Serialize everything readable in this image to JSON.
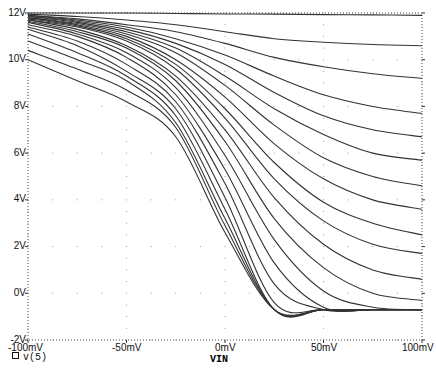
{
  "chart_data": {
    "type": "line",
    "title": "",
    "xlabel": "VIN",
    "ylabel": "",
    "xlim": [
      -100,
      100
    ],
    "ylim": [
      -2,
      12
    ],
    "x_unit": "mV",
    "y_unit": "V",
    "x_ticks": [
      "-100mV",
      "-50mV",
      "0mV",
      "50mV",
      "100mV"
    ],
    "y_ticks": [
      "-2V",
      "0V",
      "2V",
      "4V",
      "6V",
      "8V",
      "10V",
      "12V"
    ],
    "grid": "dotted",
    "legend": [
      {
        "marker": "square",
        "label": "v(5)"
      }
    ],
    "x": [
      -100,
      -75,
      -50,
      -25,
      0,
      25,
      50,
      75,
      100
    ],
    "series": [
      {
        "name": "v(5) #1",
        "values": [
          12.0,
          12.0,
          12.0,
          11.98,
          11.96,
          11.95,
          11.93,
          11.92,
          11.9
        ]
      },
      {
        "name": "v(5) #2",
        "values": [
          11.95,
          11.85,
          11.7,
          11.5,
          11.2,
          10.9,
          10.75,
          10.65,
          10.6
        ]
      },
      {
        "name": "v(5) #3",
        "values": [
          11.9,
          11.75,
          11.5,
          11.2,
          10.7,
          10.1,
          9.7,
          9.4,
          9.2
        ]
      },
      {
        "name": "v(5) #4",
        "values": [
          11.9,
          11.7,
          11.4,
          10.9,
          10.2,
          9.3,
          8.5,
          8.0,
          7.7
        ]
      },
      {
        "name": "v(5) #5",
        "values": [
          11.85,
          11.65,
          11.3,
          10.7,
          9.8,
          8.6,
          7.6,
          7.0,
          6.7
        ]
      },
      {
        "name": "v(5) #6",
        "values": [
          11.85,
          11.6,
          11.2,
          10.5,
          9.3,
          7.9,
          6.8,
          6.0,
          5.7
        ]
      },
      {
        "name": "v(5) #7",
        "values": [
          11.8,
          11.55,
          11.1,
          10.3,
          8.9,
          7.2,
          5.8,
          5.0,
          4.6
        ]
      },
      {
        "name": "v(5) #8",
        "values": [
          11.8,
          11.5,
          11.0,
          10.0,
          8.4,
          6.4,
          4.9,
          4.0,
          3.6
        ]
      },
      {
        "name": "v(5) #9",
        "values": [
          11.75,
          11.45,
          10.9,
          9.8,
          7.9,
          5.6,
          3.9,
          3.0,
          2.5
        ]
      },
      {
        "name": "v(5) #10",
        "values": [
          11.7,
          11.4,
          10.8,
          9.6,
          7.5,
          4.9,
          3.1,
          2.1,
          1.7
        ]
      },
      {
        "name": "v(5) #11",
        "values": [
          11.7,
          11.3,
          10.6,
          9.3,
          7.0,
          4.1,
          2.1,
          1.0,
          0.6
        ]
      },
      {
        "name": "v(5) #12",
        "values": [
          11.65,
          11.2,
          10.5,
          9.1,
          6.5,
          3.2,
          1.1,
          0.0,
          -0.3
        ]
      },
      {
        "name": "v(5) #13",
        "values": [
          11.6,
          11.1,
          10.3,
          8.8,
          5.9,
          2.3,
          0.1,
          -0.6,
          -0.7
        ]
      },
      {
        "name": "v(5) #14",
        "values": [
          11.5,
          11.0,
          10.1,
          8.5,
          5.3,
          1.3,
          -0.6,
          -0.7,
          -0.7
        ]
      },
      {
        "name": "v(5) #15",
        "values": [
          11.4,
          10.8,
          9.8,
          8.2,
          4.7,
          0.4,
          -0.7,
          -0.7,
          -0.7
        ]
      },
      {
        "name": "v(5) #16",
        "values": [
          11.3,
          10.6,
          9.5,
          7.9,
          4.1,
          -0.4,
          -0.7,
          -0.7,
          -0.7
        ]
      },
      {
        "name": "v(5) #17",
        "values": [
          11.1,
          10.3,
          9.3,
          7.6,
          3.6,
          -0.7,
          -0.7,
          -0.7,
          -0.7
        ]
      },
      {
        "name": "v(5) #18",
        "values": [
          10.8,
          10.0,
          9.1,
          7.3,
          3.2,
          -0.7,
          -0.7,
          -0.7,
          -0.7
        ]
      },
      {
        "name": "v(5) #19",
        "values": [
          10.4,
          9.6,
          8.7,
          7.1,
          2.9,
          -0.7,
          -0.7,
          -0.7,
          -0.7
        ]
      },
      {
        "name": "v(5) #20",
        "values": [
          10.0,
          9.1,
          8.2,
          6.7,
          2.6,
          -0.7,
          -0.7,
          -0.7,
          -0.7
        ]
      }
    ]
  },
  "axis": {
    "x_label": "VIN"
  },
  "legend": {
    "label": "v(5)"
  },
  "y_tick_labels": [
    "12V",
    "10V",
    "8V",
    "6V",
    "4V",
    "2V",
    "0V",
    "-2V"
  ],
  "x_tick_labels": [
    "-100mV",
    "-50mV",
    "0mV",
    "50mV",
    "100mV"
  ]
}
